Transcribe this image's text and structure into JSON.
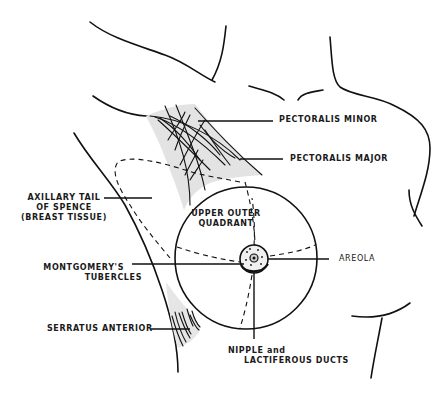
{
  "diagram": {
    "colors": {
      "line": "#111111",
      "muscle_shade": "#e3e3e3",
      "background": "#ffffff"
    },
    "labels": {
      "pectoralis_minor": "PECTORALIS MINOR",
      "pectoralis_major": "PECTORALIS MAJOR",
      "axillary_tail": {
        "line1": "AXILLARY TAIL",
        "line2": "OF SPENCE",
        "line3": "(BREAST TISSUE)"
      },
      "upper_outer_quadrant": {
        "line1": "UPPER OUTER",
        "line2": "QUADRANT"
      },
      "areola": "AREOLA",
      "montgomerys_tubercles": {
        "line1": "MONTGOMERY'S",
        "line2": "TUBERCLES"
      },
      "serratus_anterior": "SERRATUS ANTERIOR",
      "nipple": {
        "line1": "NIPPLE and",
        "line2": "LACTIFEROUS DUCTS"
      }
    }
  }
}
